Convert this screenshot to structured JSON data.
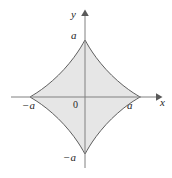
{
  "figure": {
    "kind": "math-curve-plot",
    "curve_name": "astroid",
    "axes": {
      "x_axis_label": "x",
      "y_axis_label": "y",
      "origin_label": "0"
    },
    "ticks": {
      "x_negative": "−a",
      "x_positive": "a",
      "y_positive": "a",
      "y_negative": "−a"
    },
    "colors": {
      "fill": "#e6e6e6",
      "curve_stroke": "#4d4d4d",
      "axis_stroke": "#808080",
      "label_text": "#262626",
      "background": "#ffffff"
    }
  },
  "chart_data": {
    "type": "line",
    "title": "",
    "xlabel": "x",
    "ylabel": "y",
    "xlim": [
      -1.45,
      1.6
    ],
    "ylim": [
      -1.6,
      1.6
    ],
    "grid": false,
    "legend": null,
    "equation": "x^(2/3) + y^(2/3) = a^(2/3)",
    "parametric": "x = a cos^3(t), y = a sin^3(t)",
    "filled": true,
    "xticks": [
      -1,
      1
    ],
    "xticklabels": [
      "−a",
      "a"
    ],
    "yticks": [
      -1,
      1
    ],
    "yticklabels": [
      "−a",
      "a"
    ],
    "cusps": [
      {
        "x": 1,
        "y": 0,
        "label": "a"
      },
      {
        "x": 0,
        "y": 1,
        "label": "a"
      },
      {
        "x": -1,
        "y": 0,
        "label": "−a"
      },
      {
        "x": 0,
        "y": -1,
        "label": "−a"
      }
    ],
    "series": [
      {
        "name": "astroid",
        "x": [
          1.0,
          0.985,
          0.942,
          0.875,
          0.79,
          0.693,
          0.59,
          0.484,
          0.382,
          0.287,
          0.203,
          0.132,
          0.075,
          0.035,
          0.009,
          0.0,
          -0.009,
          -0.035,
          -0.075,
          -0.132,
          -0.203,
          -0.287,
          -0.382,
          -0.484,
          -0.59,
          -0.693,
          -0.79,
          -0.875,
          -0.942,
          -0.985,
          -1.0,
          -0.985,
          -0.942,
          -0.875,
          -0.79,
          -0.693,
          -0.59,
          -0.484,
          -0.382,
          -0.287,
          -0.203,
          -0.132,
          -0.075,
          -0.035,
          -0.009,
          0.0,
          0.009,
          0.035,
          0.075,
          0.132,
          0.203,
          0.287,
          0.382,
          0.484,
          0.59,
          0.693,
          0.79,
          0.875,
          0.942,
          0.985,
          1.0
        ],
        "y": [
          0.0,
          0.009,
          0.035,
          0.075,
          0.132,
          0.203,
          0.287,
          0.382,
          0.484,
          0.59,
          0.693,
          0.79,
          0.875,
          0.942,
          0.985,
          1.0,
          0.985,
          0.942,
          0.875,
          0.79,
          0.693,
          0.59,
          0.484,
          0.382,
          0.287,
          0.203,
          0.132,
          0.075,
          0.035,
          0.009,
          0.0,
          -0.009,
          -0.035,
          -0.075,
          -0.132,
          -0.203,
          -0.287,
          -0.382,
          -0.484,
          -0.59,
          -0.693,
          -0.79,
          -0.875,
          -0.942,
          -0.985,
          -1.0,
          -0.985,
          -0.942,
          -0.875,
          -0.79,
          -0.693,
          -0.59,
          -0.484,
          -0.382,
          -0.287,
          -0.203,
          -0.132,
          -0.075,
          -0.035,
          -0.009,
          0.0
        ]
      }
    ]
  }
}
